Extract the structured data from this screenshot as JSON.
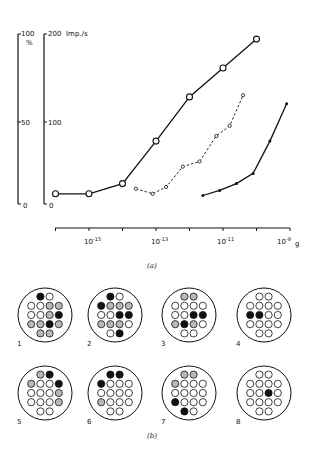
{
  "figure": {
    "caption_a": "(a)",
    "caption_b": "(b)"
  },
  "chart_data": {
    "type": "line",
    "title": "",
    "xlabel": "g",
    "xscale": "log",
    "xlim": [
      -16,
      -9
    ],
    "x_ticks": [
      "10^-15",
      "10^-13",
      "10^-11",
      "10^-9"
    ],
    "x_tick_exponents": [
      -15,
      -13,
      -11,
      -9
    ],
    "y_axes": [
      {
        "label": "%",
        "ticks": [
          "0",
          "50",
          "100"
        ],
        "range": [
          0,
          100
        ]
      },
      {
        "label": "Imp./s",
        "ticks": [
          "0",
          "100",
          "200"
        ],
        "range": [
          0,
          200
        ]
      }
    ],
    "grid": false,
    "legend": null,
    "series": [
      {
        "name": "open-circles-solid",
        "style": "solid, large open circles",
        "x_log10": [
          -16.0,
          -15.0,
          -14.0,
          -13.0,
          -12.0,
          -11.0,
          -10.0
        ],
        "y_percent": [
          6,
          6,
          12,
          37,
          63,
          80,
          97
        ]
      },
      {
        "name": "small-open-circles-dashed",
        "style": "dashed, small open circles",
        "x_log10": [
          -13.6,
          -13.1,
          -12.7,
          -12.2,
          -11.7,
          -11.2,
          -10.8,
          -10.4
        ],
        "y_percent": [
          9,
          6,
          10,
          22,
          25,
          40,
          46,
          64
        ]
      },
      {
        "name": "filled-dots-solid",
        "style": "solid, small filled dots",
        "x_log10": [
          -11.6,
          -11.1,
          -10.6,
          -10.1,
          -9.6,
          -9.1
        ],
        "y_percent": [
          5,
          8,
          12,
          18,
          37,
          59
        ]
      }
    ]
  },
  "panel_b": {
    "dot_legend": {
      "filled": "black",
      "shaded": "grey",
      "empty": "white"
    },
    "grids": [
      {
        "id": "1",
        "rows": [
          [
            "F",
            "E"
          ],
          [
            "E",
            "E",
            "S",
            "S"
          ],
          [
            "E",
            "E",
            "S",
            "F"
          ],
          [
            "S",
            "S",
            "F",
            "S"
          ],
          [
            "S",
            "S"
          ]
        ]
      },
      {
        "id": "2",
        "rows": [
          [
            "F",
            "E"
          ],
          [
            "F",
            "S",
            "S",
            "S"
          ],
          [
            "E",
            "E",
            "F",
            "F"
          ],
          [
            "S",
            "S",
            "S",
            "E"
          ],
          [
            "E",
            "F"
          ]
        ]
      },
      {
        "id": "3",
        "rows": [
          [
            "S",
            "S"
          ],
          [
            "E",
            "E",
            "E",
            "E"
          ],
          [
            "E",
            "E",
            "F",
            "F"
          ],
          [
            "S",
            "F",
            "S",
            "E"
          ],
          [
            "E",
            "E"
          ]
        ]
      },
      {
        "id": "4",
        "rows": [
          [
            "E",
            "E"
          ],
          [
            "E",
            "E",
            "E",
            "E"
          ],
          [
            "F",
            "F",
            "E",
            "E"
          ],
          [
            "E",
            "E",
            "E",
            "E"
          ],
          [
            "E",
            "E"
          ]
        ]
      },
      {
        "id": "5",
        "rows": [
          [
            "S",
            "F"
          ],
          [
            "S",
            "E",
            "E",
            "F"
          ],
          [
            "E",
            "E",
            "E",
            "S"
          ],
          [
            "E",
            "E",
            "E",
            "S"
          ],
          [
            "E",
            "E"
          ]
        ]
      },
      {
        "id": "6",
        "rows": [
          [
            "F",
            "F"
          ],
          [
            "F",
            "E",
            "E",
            "E"
          ],
          [
            "E",
            "E",
            "E",
            "E"
          ],
          [
            "S",
            "E",
            "E",
            "E"
          ],
          [
            "E",
            "E"
          ]
        ]
      },
      {
        "id": "7",
        "rows": [
          [
            "S",
            "S"
          ],
          [
            "S",
            "E",
            "E",
            "E"
          ],
          [
            "E",
            "E",
            "E",
            "E"
          ],
          [
            "F",
            "E",
            "E",
            "E"
          ],
          [
            "F",
            "E"
          ]
        ]
      },
      {
        "id": "8",
        "rows": [
          [
            "E",
            "E"
          ],
          [
            "E",
            "E",
            "E",
            "E"
          ],
          [
            "E",
            "E",
            "F",
            "E"
          ],
          [
            "E",
            "E",
            "E",
            "E"
          ],
          [
            "E",
            "E"
          ]
        ]
      }
    ]
  }
}
